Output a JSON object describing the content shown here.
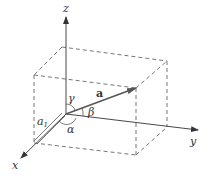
{
  "diagram": {
    "colors": {
      "axis": "#333333",
      "dashed": "#666666",
      "vector": "#555555",
      "background": "#ffffff"
    },
    "axes": {
      "x": {
        "label": "x"
      },
      "y": {
        "label": "y"
      },
      "z": {
        "label": "z"
      }
    },
    "vector": {
      "label": "a"
    },
    "component": {
      "label": "a",
      "subscript": "1"
    },
    "angles": {
      "alpha": "α",
      "beta": "β",
      "gamma": "γ"
    }
  }
}
